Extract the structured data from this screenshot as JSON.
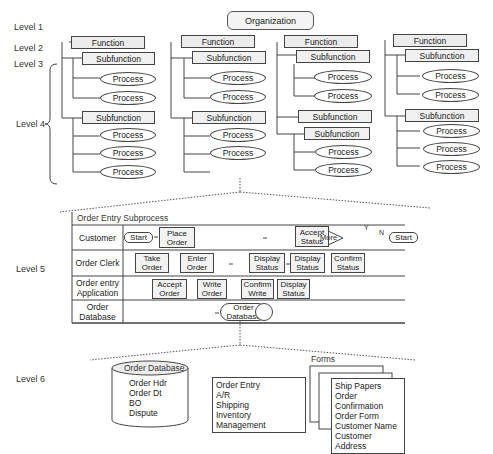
{
  "levels": [
    "Level 1",
    "Level 2",
    "Level 3",
    "Level 4",
    "Level 5",
    "Level 6"
  ],
  "organization": "Organization",
  "columns": [
    {
      "function": "Function",
      "groups": [
        {
          "subfunctions": [
            "Subfunction"
          ],
          "processes": [
            "Process",
            "Process"
          ]
        },
        {
          "subfunctions": [
            "Subfunction"
          ],
          "processes": [
            "Process",
            "Process",
            "Process"
          ]
        }
      ]
    },
    {
      "function": "Function",
      "groups": [
        {
          "subfunctions": [
            "Subfunction"
          ],
          "processes": [
            "Process",
            "Process"
          ]
        },
        {
          "subfunctions": [
            "Subfunction"
          ],
          "processes": [
            "Process",
            "Process"
          ]
        }
      ]
    },
    {
      "function": "Function",
      "groups": [
        {
          "subfunctions": [
            "Subfunction"
          ],
          "processes": [
            "Process",
            "Process"
          ]
        },
        {
          "subfunctions": [
            "Subfunction",
            "Subfunction"
          ],
          "processes": [
            "Process",
            "Process"
          ]
        }
      ]
    },
    {
      "function": "Function",
      "groups": [
        {
          "subfunctions": [
            "Subfunction"
          ],
          "processes": [
            "Process",
            "Process"
          ]
        },
        {
          "subfunctions": [
            "Subfunction"
          ],
          "processes": [
            "Process",
            "Process",
            "Process"
          ]
        }
      ]
    }
  ],
  "swimlane": {
    "title": "Order Entry Subprocess",
    "lanes": [
      {
        "label": "Customer"
      },
      {
        "label": "Order Clerk"
      },
      {
        "label": "Order entry Application"
      },
      {
        "label": "Order Database"
      }
    ],
    "customer": {
      "start": "Start",
      "place_order": "Place Order",
      "accept_status": "Accept Status",
      "more": "More",
      "yes": "Y",
      "no": "N",
      "end": "Start"
    },
    "clerk": {
      "take_order": "Take Order",
      "enter_order": "Enter Order",
      "display1": "Display Status",
      "display2": "Display Status",
      "confirm": "Confirm Status"
    },
    "app": {
      "accept_order": "Accept Order",
      "write_order": "Write Order",
      "confirm_write": "Confirm Write",
      "display_status": "Display Status"
    },
    "db": {
      "order_database": "Order Database"
    }
  },
  "level6": {
    "database": {
      "title": "Order Database",
      "items": [
        "Order Hdr",
        "Order Dt",
        "BO",
        "Dispute"
      ]
    },
    "apps": [
      "Order Entry",
      "A/R",
      "Shipping",
      "Inventory Management"
    ],
    "forms": {
      "title": "Forms",
      "items": [
        "Ship Papers",
        "Order Confirmation",
        "Order Form",
        "Customer Name",
        "Customer Address"
      ]
    }
  }
}
